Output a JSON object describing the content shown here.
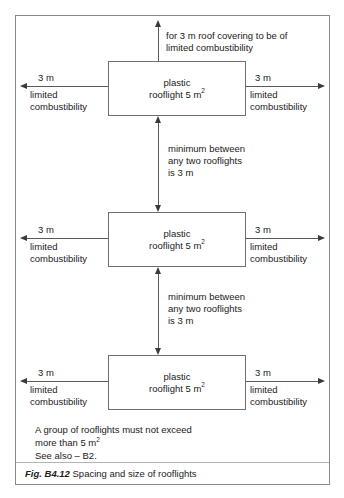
{
  "figure": {
    "caption_number": "Fig. B4.12",
    "caption_title": "Spacing and size of rooflights"
  },
  "rooflights": [
    {
      "line1": "plastic",
      "line2_prefix": "rooflight 5 m",
      "line2_sup": "2"
    },
    {
      "line1": "plastic",
      "line2_prefix": "rooflight 5 m",
      "line2_sup": "2"
    },
    {
      "line1": "plastic",
      "line2_prefix": "rooflight 5 m",
      "line2_sup": "2"
    }
  ],
  "annotations": {
    "top_note_line1": "for 3 m roof covering to be of",
    "top_note_line2": "limited combustibility",
    "gap_note_1_line1": "minimum between",
    "gap_note_1_line2": "any two rooflights",
    "gap_note_1_line3": "is 3 m",
    "gap_note_2_line1": "minimum between",
    "gap_note_2_line2": "any two rooflights",
    "gap_note_2_line3": "is 3 m"
  },
  "side_labels": {
    "distance": "3 m",
    "desc_line1": "limited",
    "desc_line2": "combustibility"
  },
  "footnotes": {
    "group_note_line1": "A group of rooflights must not exceed",
    "group_note_line2_prefix": "more than 5 m",
    "group_note_line2_sup": "2",
    "see_also": "See also – B2."
  },
  "colors": {
    "frame": "#8a8a8a",
    "box_border": "#6f6f6f",
    "line": "#5a5a5a",
    "arrow": "#3a3a3a",
    "text": "#1a1a1a",
    "background": "#ffffff"
  }
}
